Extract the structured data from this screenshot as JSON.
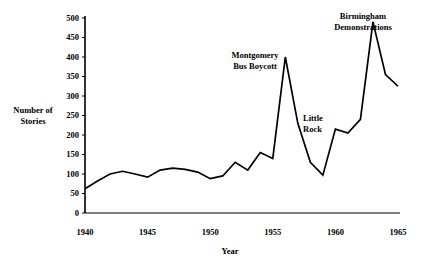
{
  "chart_data": {
    "type": "line",
    "title": "",
    "xlabel": "Year",
    "ylabel": "Number of Stories",
    "ylabel_line1": "Number of",
    "ylabel_line2": "Stories",
    "xlim": [
      1940,
      1965
    ],
    "ylim": [
      0,
      500
    ],
    "grid": false,
    "legend": null,
    "ytick_labels": [
      "0",
      "50",
      "100",
      "150",
      "200",
      "250",
      "300",
      "350",
      "400",
      "450",
      "500"
    ],
    "ytick_values": [
      0,
      50,
      100,
      150,
      200,
      250,
      300,
      350,
      400,
      450,
      500
    ],
    "xtick_labels": [
      "1940",
      "1945",
      "1950",
      "1955",
      "1960",
      "1965"
    ],
    "xtick_values": [
      1940,
      1945,
      1950,
      1955,
      1960,
      1965
    ],
    "x": [
      1940,
      1941,
      1942,
      1943,
      1944,
      1945,
      1946,
      1947,
      1948,
      1949,
      1950,
      1951,
      1952,
      1953,
      1954,
      1955,
      1956,
      1957,
      1958,
      1959,
      1960,
      1961,
      1962,
      1963,
      1964,
      1965
    ],
    "values": [
      62,
      82,
      100,
      107,
      100,
      92,
      110,
      115,
      112,
      105,
      88,
      95,
      130,
      110,
      155,
      140,
      400,
      230,
      130,
      97,
      215,
      205,
      240,
      490,
      355,
      325
    ],
    "series": [
      {
        "name": "Number of Stories",
        "values": [
          62,
          82,
          100,
          107,
          100,
          92,
          110,
          115,
          112,
          105,
          88,
          95,
          130,
          110,
          155,
          140,
          400,
          230,
          130,
          97,
          215,
          205,
          240,
          490,
          355,
          325
        ]
      }
    ],
    "annotations": [
      {
        "id": "montgomery",
        "line1": "Montgomery",
        "line2": "Bus Boycott",
        "x": 1956,
        "y": 400
      },
      {
        "id": "little-rock",
        "line1": "Little",
        "line2": "Rock",
        "x": 1957,
        "y": 230
      },
      {
        "id": "birmingham",
        "line1": "Birmingham",
        "line2": "Demonstrations",
        "x": 1963,
        "y": 490
      }
    ],
    "line_color": "#000000",
    "axis_color": "#000000",
    "background_color": "#ffffff"
  }
}
